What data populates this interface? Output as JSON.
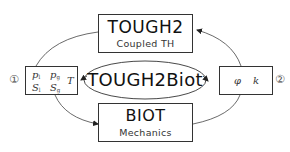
{
  "diagram": {
    "center": {
      "label": "TOUGH2Biot"
    },
    "top_module": {
      "title": "TOUGH2",
      "subtitle": "Coupled TH"
    },
    "bottom_module": {
      "title": "BIOT",
      "subtitle": "Mechanics"
    },
    "left_variables": {
      "marker": "①",
      "items": [
        {
          "sym": "p",
          "sub": "l"
        },
        {
          "sym": "p",
          "sub": "g"
        },
        {
          "sym": "S",
          "sub": "l"
        },
        {
          "sym": "S",
          "sub": "g"
        },
        {
          "sym": "T",
          "sub": ""
        }
      ]
    },
    "right_variables": {
      "marker": "②",
      "items": [
        {
          "sym": "φ",
          "sub": ""
        },
        {
          "sym": "k",
          "sub": ""
        }
      ]
    },
    "edges": [
      {
        "from": "left_variables",
        "to": "top_module"
      },
      {
        "from": "right_variables",
        "to": "top_module"
      },
      {
        "from": "left_variables",
        "to": "bottom_module"
      },
      {
        "from": "bottom_module",
        "to": "right_variables"
      },
      {
        "from": "center",
        "to": "left_variables"
      },
      {
        "from": "center",
        "to": "right_variables"
      }
    ],
    "colors": {
      "line": "#333333",
      "background": "#ffffff"
    }
  }
}
